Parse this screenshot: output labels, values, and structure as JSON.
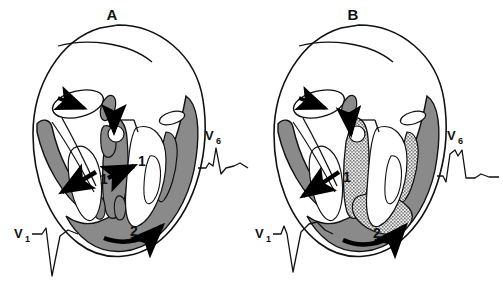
{
  "figure": {
    "background_color": "#ffffff",
    "outline_color": "#111111",
    "myocardium_fill": "#8a8a8a",
    "chamber_fill": "#ffffff",
    "infarct_fill": "#9a9a9a",
    "arrow_color": "#000000"
  },
  "panels": [
    {
      "id": "A",
      "letter": "A",
      "description": "Normal septal and ventricular activation",
      "has_stippled_region": false,
      "activation_steps": [
        {
          "number": "1",
          "position": "left-septal",
          "description": "left-to-right septal activation arrow"
        },
        {
          "number": "1",
          "position": "right-septal",
          "description": "right septal activation arrow"
        },
        {
          "number": "2",
          "position": "apical-free-wall",
          "description": "apical to basal free wall activation"
        }
      ],
      "conduction_arrows": [
        {
          "name": "sinus-node-arrow",
          "direction": "right",
          "description": "atrial impulse entering AV node"
        },
        {
          "name": "his-bundle-arrow",
          "direction": "down",
          "description": "impulse descending His bundle"
        }
      ],
      "ecg_leads": [
        {
          "lead": "V",
          "subscript": "1",
          "label": "V1",
          "morphology": "rS complex with deep S wave",
          "position": "lower-left"
        },
        {
          "lead": "V",
          "subscript": "6",
          "label": "V6",
          "morphology": "tall monophasic R wave with small q",
          "position": "upper-right"
        }
      ]
    },
    {
      "id": "B",
      "letter": "B",
      "description": "Delayed activation with stippled septal and free wall region",
      "has_stippled_region": true,
      "stippled_region_label": "delayed-activation-zone",
      "activation_steps": [
        {
          "number": "1",
          "position": "left-septal",
          "description": "left septal activation arrow"
        },
        {
          "number": "2",
          "position": "apical-free-wall",
          "description": "apical to basal free wall activation"
        }
      ],
      "conduction_arrows": [
        {
          "name": "sinus-node-arrow",
          "direction": "right",
          "description": "atrial impulse entering AV node"
        },
        {
          "name": "his-bundle-arrow",
          "direction": "down",
          "description": "impulse descending His bundle"
        }
      ],
      "ecg_leads": [
        {
          "lead": "V",
          "subscript": "1",
          "label": "V1",
          "morphology": "rS complex with broad deep S wave",
          "position": "lower-left"
        },
        {
          "lead": "V",
          "subscript": "6",
          "label": "V6",
          "morphology": "broad notched R wave",
          "position": "upper-right"
        }
      ]
    }
  ]
}
